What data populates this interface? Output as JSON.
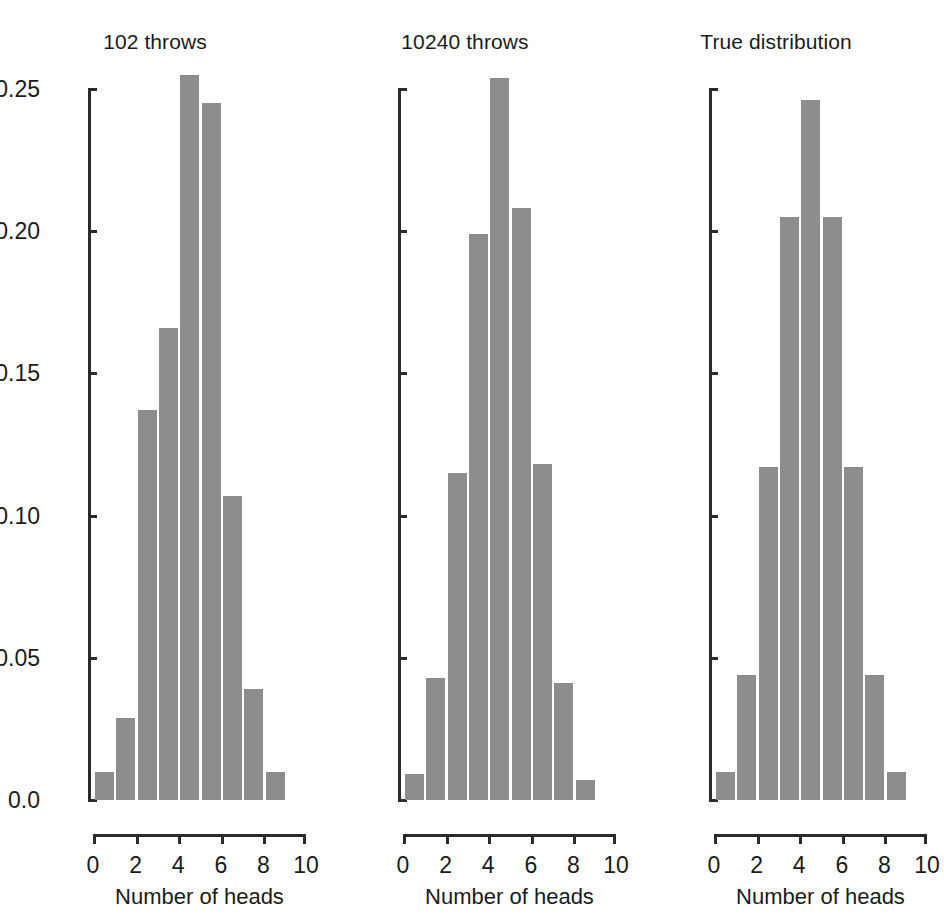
{
  "figure": {
    "background": "#ffffff",
    "bar_color": "#8d8d8d",
    "axis_color": "#2b2b2b",
    "text_color": "#1b1b1b"
  },
  "chart_data": [
    {
      "type": "bar",
      "title": "102 throws",
      "xlabel": "Number of heads",
      "ylabel": "",
      "categories": [
        1,
        2,
        3,
        4,
        5,
        6,
        7,
        8,
        9
      ],
      "values": [
        0.01,
        0.029,
        0.137,
        0.166,
        0.255,
        0.245,
        0.107,
        0.039,
        0.01
      ],
      "xlim": [
        0,
        10
      ],
      "ylim": [
        0.0,
        0.255
      ],
      "xticks": [
        "0",
        "2",
        "4",
        "6",
        "8",
        "10"
      ],
      "xtick_values": [
        0,
        2,
        4,
        6,
        8,
        10
      ],
      "yticks": [
        "0.0",
        "0.05",
        "0.10",
        "0.15",
        "0.20",
        "0.25"
      ],
      "ytick_values": [
        0.0,
        0.05,
        0.1,
        0.15,
        0.2,
        0.25
      ],
      "grid": false,
      "legend": "none"
    },
    {
      "type": "bar",
      "title": "10240 throws",
      "xlabel": "Number of heads",
      "ylabel": "",
      "categories": [
        1,
        2,
        3,
        4,
        5,
        6,
        7,
        8,
        9
      ],
      "values": [
        0.009,
        0.043,
        0.115,
        0.199,
        0.254,
        0.208,
        0.118,
        0.041,
        0.007
      ],
      "xlim": [
        0,
        10
      ],
      "ylim": [
        0.0,
        0.255
      ],
      "xticks": [
        "0",
        "2",
        "4",
        "6",
        "8",
        "10"
      ],
      "xtick_values": [
        0,
        2,
        4,
        6,
        8,
        10
      ],
      "yticks": [
        "0.0",
        "0.05",
        "0.10",
        "0.15",
        "0.20",
        "0.25"
      ],
      "ytick_values": [
        0.0,
        0.05,
        0.1,
        0.15,
        0.2,
        0.25
      ],
      "grid": false,
      "legend": "none"
    },
    {
      "type": "bar",
      "title": "True distribution",
      "xlabel": "Number of heads",
      "ylabel": "",
      "categories": [
        1,
        2,
        3,
        4,
        5,
        6,
        7,
        8,
        9
      ],
      "values": [
        0.01,
        0.044,
        0.117,
        0.205,
        0.246,
        0.205,
        0.117,
        0.044,
        0.01
      ],
      "xlim": [
        0,
        10
      ],
      "ylim": [
        0.0,
        0.255
      ],
      "xticks": [
        "0",
        "2",
        "4",
        "6",
        "8",
        "10"
      ],
      "xtick_values": [
        0,
        2,
        4,
        6,
        8,
        10
      ],
      "yticks": [
        "0.0",
        "0.05",
        "0.10",
        "0.15",
        "0.20",
        "0.25"
      ],
      "ytick_values": [
        0.0,
        0.05,
        0.1,
        0.15,
        0.2,
        0.25
      ],
      "grid": false,
      "legend": "none"
    }
  ]
}
